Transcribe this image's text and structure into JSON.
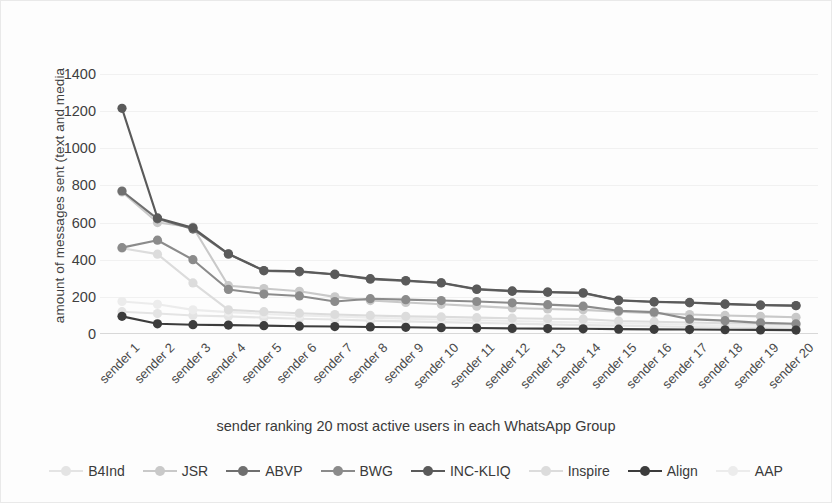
{
  "chart_data": {
    "type": "line",
    "title": "",
    "xlabel": "sender ranking 20 most active users in each WhatsApp Group",
    "ylabel": "amount of messages sent (text and media",
    "ylim": [
      0,
      1400
    ],
    "ytick_step": 200,
    "yticks": [
      "1400",
      "1200",
      "1000",
      "800",
      "600",
      "400",
      "200",
      "0"
    ],
    "grid": true,
    "legend_position": "bottom",
    "categories": [
      "sender 1",
      "sender 2",
      "sender 3",
      "sender 4",
      "sender 5",
      "sender 6",
      "sender 7",
      "sender 8",
      "sender 9",
      "sender 10",
      "sender 11",
      "sender 12",
      "sender 13",
      "sender 14",
      "sender 15",
      "sender 16",
      "sender 17",
      "sender 18",
      "sender 19",
      "sender 20"
    ],
    "series": [
      {
        "name": "B4Ind",
        "color": "#e4e4e4",
        "values": [
          120,
          110,
          100,
          95,
          88,
          82,
          78,
          72,
          68,
          64,
          60,
          56,
          52,
          48,
          45,
          42,
          38,
          35,
          32,
          30
        ]
      },
      {
        "name": "JSR",
        "color": "#c9c9c9",
        "values": [
          765,
          600,
          575,
          260,
          245,
          230,
          200,
          180,
          170,
          160,
          150,
          140,
          135,
          130,
          120,
          112,
          105,
          100,
          95,
          90
        ]
      },
      {
        "name": "ABVP",
        "color": "#6f6f6f",
        "values": [
          770,
          620,
          565,
          430,
          340,
          335,
          320,
          295,
          285,
          275,
          240,
          230,
          225,
          220,
          180,
          172,
          168,
          160,
          155,
          152
        ]
      },
      {
        "name": "BWG",
        "color": "#8b8b8b",
        "values": [
          465,
          505,
          400,
          240,
          215,
          205,
          175,
          190,
          185,
          180,
          175,
          168,
          158,
          150,
          125,
          118,
          80,
          72,
          60,
          55
        ]
      },
      {
        "name": "INC-KLIQ",
        "color": "#5a5a5a",
        "values": [
          1215,
          625,
          572,
          432,
          342,
          338,
          322,
          298,
          288,
          276,
          242,
          232,
          226,
          222,
          182,
          174,
          170,
          162,
          156,
          153
        ]
      },
      {
        "name": "Inspire",
        "color": "#dcdcdc",
        "values": [
          462,
          430,
          275,
          130,
          120,
          112,
          105,
          100,
          95,
          92,
          88,
          85,
          82,
          80,
          70,
          66,
          62,
          58,
          55,
          52
        ]
      },
      {
        "name": "Align",
        "color": "#3c3c3c",
        "values": [
          95,
          55,
          50,
          48,
          45,
          42,
          40,
          38,
          36,
          34,
          32,
          30,
          29,
          28,
          26,
          25,
          24,
          23,
          22,
          21
        ]
      },
      {
        "name": "AAP",
        "color": "#ececec",
        "values": [
          175,
          160,
          130,
          118,
          108,
          100,
          95,
          88,
          82,
          78,
          74,
          70,
          66,
          62,
          58,
          54,
          50,
          46,
          44,
          42
        ]
      }
    ]
  }
}
